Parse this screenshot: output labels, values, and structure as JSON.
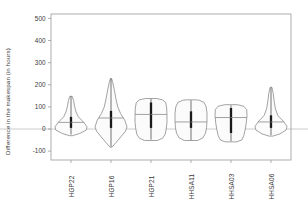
{
  "chart_data": {
    "type": "violin",
    "title": "",
    "xlabel": "",
    "ylabel": "Difference in the makespan (in hours)",
    "ylim": [
      -140,
      520
    ],
    "yticks": [
      -100,
      0,
      100,
      200,
      300,
      400,
      500
    ],
    "ytick_labels": [
      "-100",
      "0",
      "100",
      "200",
      "300",
      "400",
      "500"
    ],
    "grid": false,
    "legend": "none",
    "zero_reference_line": 0,
    "categories": [
      "HGP22",
      "HGP16",
      "HGP21",
      "HHSA11",
      "HHSA03",
      "HHSA06"
    ],
    "series": [
      {
        "name": "HGP22",
        "median": 30,
        "q1": 5,
        "q3": 55,
        "whisker_low": -25,
        "whisker_high": 148,
        "density_min": -30,
        "density_max": 148,
        "shape": "teardrop-up",
        "density_profile": [
          {
            "y": -30,
            "w": 0.1
          },
          {
            "y": -20,
            "w": 0.55
          },
          {
            "y": -5,
            "w": 0.95
          },
          {
            "y": 10,
            "w": 1.0
          },
          {
            "y": 30,
            "w": 0.8
          },
          {
            "y": 55,
            "w": 0.46
          },
          {
            "y": 80,
            "w": 0.3
          },
          {
            "y": 105,
            "w": 0.22
          },
          {
            "y": 130,
            "w": 0.16
          },
          {
            "y": 148,
            "w": 0.07
          }
        ]
      },
      {
        "name": "HGP16",
        "median": 50,
        "q1": 5,
        "q3": 82,
        "whisker_low": -80,
        "whisker_high": 228,
        "density_min": -82,
        "density_max": 228,
        "shape": "diamond",
        "density_profile": [
          {
            "y": -82,
            "w": 0.06
          },
          {
            "y": -60,
            "w": 0.33
          },
          {
            "y": -35,
            "w": 0.62
          },
          {
            "y": -10,
            "w": 0.9
          },
          {
            "y": 10,
            "w": 1.0
          },
          {
            "y": 40,
            "w": 0.86
          },
          {
            "y": 70,
            "w": 0.6
          },
          {
            "y": 100,
            "w": 0.42
          },
          {
            "y": 140,
            "w": 0.3
          },
          {
            "y": 180,
            "w": 0.2
          },
          {
            "y": 210,
            "w": 0.11
          },
          {
            "y": 228,
            "w": 0.04
          }
        ]
      },
      {
        "name": "HGP21",
        "median": 66,
        "q1": 5,
        "q3": 120,
        "whisker_low": -48,
        "whisker_high": 136,
        "density_min": -52,
        "density_max": 138,
        "shape": "boxy",
        "density_profile": [
          {
            "y": -52,
            "w": 0.4
          },
          {
            "y": -42,
            "w": 0.72
          },
          {
            "y": -25,
            "w": 0.88
          },
          {
            "y": 0,
            "w": 0.95
          },
          {
            "y": 30,
            "w": 1.0
          },
          {
            "y": 60,
            "w": 1.0
          },
          {
            "y": 95,
            "w": 0.98
          },
          {
            "y": 120,
            "w": 0.92
          },
          {
            "y": 132,
            "w": 0.72
          },
          {
            "y": 138,
            "w": 0.35
          }
        ]
      },
      {
        "name": "HHSA11",
        "median": 32,
        "q1": 5,
        "q3": 80,
        "whisker_low": -50,
        "whisker_high": 130,
        "density_min": -52,
        "density_max": 132,
        "shape": "boxy",
        "density_profile": [
          {
            "y": -52,
            "w": 0.42
          },
          {
            "y": -40,
            "w": 0.74
          },
          {
            "y": -20,
            "w": 0.9
          },
          {
            "y": 5,
            "w": 0.97
          },
          {
            "y": 35,
            "w": 1.0
          },
          {
            "y": 70,
            "w": 1.0
          },
          {
            "y": 100,
            "w": 0.95
          },
          {
            "y": 120,
            "w": 0.82
          },
          {
            "y": 130,
            "w": 0.52
          },
          {
            "y": 132,
            "w": 0.3
          }
        ]
      },
      {
        "name": "HHSA03",
        "median": 52,
        "q1": -18,
        "q3": 95,
        "whisker_low": -55,
        "whisker_high": 107,
        "density_min": -58,
        "density_max": 110,
        "shape": "boxy",
        "density_profile": [
          {
            "y": -58,
            "w": 0.36
          },
          {
            "y": -50,
            "w": 0.66
          },
          {
            "y": -30,
            "w": 0.8
          },
          {
            "y": -5,
            "w": 0.88
          },
          {
            "y": 25,
            "w": 0.95
          },
          {
            "y": 60,
            "w": 1.0
          },
          {
            "y": 88,
            "w": 0.98
          },
          {
            "y": 103,
            "w": 0.8
          },
          {
            "y": 110,
            "w": 0.4
          }
        ]
      },
      {
        "name": "HHSA06",
        "median": 32,
        "q1": 5,
        "q3": 62,
        "whisker_low": -28,
        "whisker_high": 188,
        "density_min": -32,
        "density_max": 190,
        "shape": "teardrop-up",
        "density_profile": [
          {
            "y": -32,
            "w": 0.12
          },
          {
            "y": -22,
            "w": 0.56
          },
          {
            "y": -5,
            "w": 0.94
          },
          {
            "y": 12,
            "w": 1.0
          },
          {
            "y": 35,
            "w": 0.78
          },
          {
            "y": 60,
            "w": 0.44
          },
          {
            "y": 90,
            "w": 0.28
          },
          {
            "y": 125,
            "w": 0.2
          },
          {
            "y": 160,
            "w": 0.14
          },
          {
            "y": 185,
            "w": 0.07
          },
          {
            "y": 190,
            "w": 0.03
          }
        ]
      }
    ]
  },
  "style": {
    "frame_color": "#9a9a9a",
    "violin_stroke": "#7b7b7b",
    "violin_fill": "#fbfbfb",
    "box_color": "#1a1a1a",
    "zero_line_color": "#b5b5b5",
    "text_color": "#3a3a3a",
    "background": "#ffffff"
  }
}
